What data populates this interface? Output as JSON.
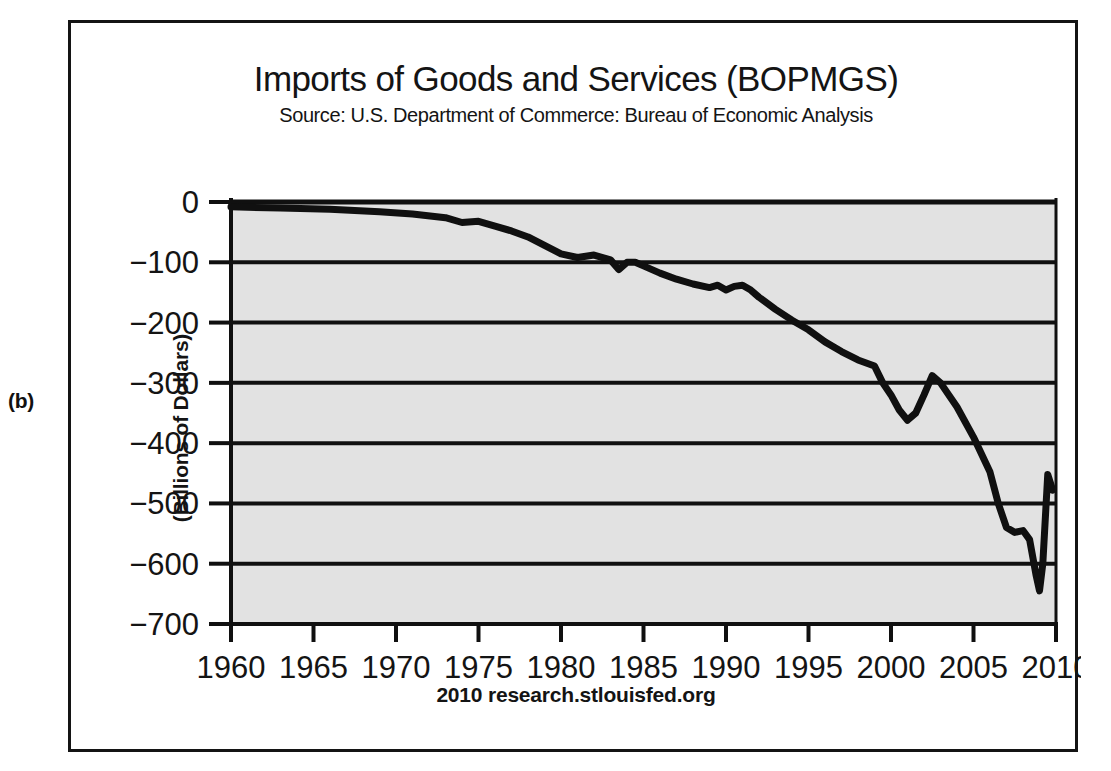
{
  "panel": {
    "label": "(b)"
  },
  "header": {
    "title": "Imports of Goods and Services (BOPMGS)",
    "subtitle": "Source: U.S. Department of Commerce: Bureau of Economic Analysis"
  },
  "footer": {
    "note": "2010 research.stlouisfed.org"
  },
  "axis": {
    "ylabel": "(Billions of Dollars)",
    "ytick_labels": [
      "0",
      "−100",
      "−200",
      "−300",
      "−400",
      "−500",
      "−600",
      "−700"
    ],
    "xtick_labels": [
      "1960",
      "1965",
      "1970",
      "1975",
      "1980",
      "1985",
      "1990",
      "1995",
      "2000",
      "2005",
      "2010"
    ]
  },
  "colors": {
    "plot_background": "#e2e2e2",
    "line": "#101010",
    "gridline": "#101010",
    "frame": "#141414",
    "text": "#141414",
    "page_background": "#ffffff"
  },
  "chart_data": {
    "type": "line",
    "title": "Imports of Goods and Services (BOPMGS)",
    "subtitle": "Source: U.S. Department of Commerce: Bureau of Economic Analysis",
    "xlabel": "",
    "ylabel": "(Billions of Dollars)",
    "xlim": [
      1960,
      2010
    ],
    "ylim": [
      -700,
      0
    ],
    "yticks": [
      0,
      -100,
      -200,
      -300,
      -400,
      -500,
      -600,
      -700
    ],
    "xticks": [
      1960,
      1965,
      1970,
      1975,
      1980,
      1985,
      1990,
      1995,
      2000,
      2005,
      2010
    ],
    "grid": "horizontal",
    "legend": "none",
    "series": [
      {
        "name": "Imports of Goods and Services (BOPMGS)",
        "x": [
          1960,
          1961,
          1962,
          1963,
          1964,
          1965,
          1966,
          1967,
          1968,
          1969,
          1970,
          1971,
          1972,
          1973,
          1974,
          1975,
          1976,
          1977,
          1978,
          1979,
          1980,
          1981,
          1982,
          1983,
          1984,
          1985,
          1986,
          1987,
          1988,
          1989,
          1990,
          1991,
          1992,
          1993,
          1994,
          1995,
          1996,
          1997,
          1998,
          1999,
          2000,
          2001,
          2002,
          2003,
          2004,
          2005,
          2006,
          2007,
          2008,
          2008.75,
          2009,
          2009.4,
          2009.8
        ],
        "y": [
          -11,
          -12,
          -13,
          -14,
          -15,
          -17,
          -19,
          -20,
          -23,
          -25,
          -27,
          -31,
          -37,
          -45,
          -67,
          -63,
          -77,
          -92,
          -105,
          -125,
          -145,
          -155,
          -150,
          -165,
          -200,
          -215,
          -230,
          -260,
          -280,
          -295,
          -305,
          -295,
          -315,
          -345,
          -400,
          -430,
          -465,
          -520,
          -560,
          -650,
          -745,
          -715,
          -760,
          -830,
          -960,
          -1070,
          -1140,
          -1165,
          -1215,
          -1100,
          -910,
          -880,
          -950
        ]
      }
    ],
    "note": "Values plotted as negative (imports shown as a negative contribution); curve descends from near 0 in 1960 to a trough of about -645 in late 2008, then rebounds sharply to about -450 before settling near -478 in 2009.",
    "plotted_points": {
      "description": "Digitized reading of the drawn curve against the -700..0 axis",
      "x": [
        1960,
        1963,
        1966,
        1969,
        1971,
        1973,
        1974,
        1975,
        1976,
        1977,
        1978,
        1979,
        1980,
        1981,
        1982,
        1983,
        1983.5,
        1984,
        1984.5,
        1985,
        1986,
        1987,
        1988,
        1989,
        1989.5,
        1990,
        1990.5,
        1991,
        1991.5,
        1992,
        1993,
        1994,
        1995,
        1996,
        1997,
        1998,
        1999,
        1999.5,
        2000,
        2000.5,
        2001,
        2001.5,
        2002,
        2002.5,
        2003,
        2004,
        2005,
        2006,
        2006.5,
        2007,
        2007.5,
        2008,
        2008.4,
        2008.8,
        2009,
        2009.2,
        2009.5,
        2009.8
      ],
      "y": [
        -8,
        -10,
        -12,
        -16,
        -20,
        -26,
        -34,
        -32,
        -40,
        -48,
        -58,
        -72,
        -86,
        -92,
        -88,
        -96,
        -112,
        -100,
        -100,
        -106,
        -118,
        -128,
        -136,
        -142,
        -138,
        -146,
        -140,
        -138,
        -146,
        -158,
        -178,
        -196,
        -212,
        -232,
        -248,
        -262,
        -272,
        -300,
        -320,
        -345,
        -362,
        -350,
        -320,
        -288,
        -300,
        -340,
        -390,
        -448,
        -500,
        -540,
        -548,
        -545,
        -560,
        -620,
        -645,
        -600,
        -452,
        -478
      ]
    }
  }
}
